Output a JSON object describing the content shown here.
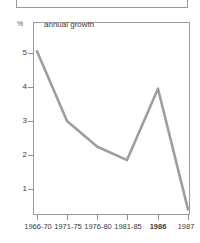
{
  "header": {
    "box_label": ""
  },
  "axis": {
    "y_unit_label": "%",
    "y_ticks": [
      "5",
      "4",
      "3",
      "2",
      "1"
    ],
    "x_ticks": [
      "1966-70",
      "1971-75",
      "1976-80",
      "1981-85",
      "1986",
      "1987"
    ]
  },
  "title": "annual growth",
  "colors": {
    "line": "#9e9e9e",
    "frame": "#9a9a9a",
    "text": "#3a3a3a"
  },
  "chart_data": {
    "type": "line",
    "title": "annual growth",
    "xlabel": "",
    "ylabel": "%",
    "categories": [
      "1966-70",
      "1971-75",
      "1976-80",
      "1981-85",
      "1986",
      "1987"
    ],
    "values": [
      5.05,
      3.0,
      2.25,
      1.85,
      3.95,
      0.4
    ],
    "series": [
      {
        "name": "annual growth",
        "values": [
          5.05,
          3.0,
          2.25,
          1.85,
          3.95,
          0.4
        ]
      }
    ],
    "ylim": [
      0,
      5.7
    ],
    "ytick_values": [
      5,
      4,
      3,
      2,
      1
    ],
    "grid": false,
    "legend": "none"
  }
}
